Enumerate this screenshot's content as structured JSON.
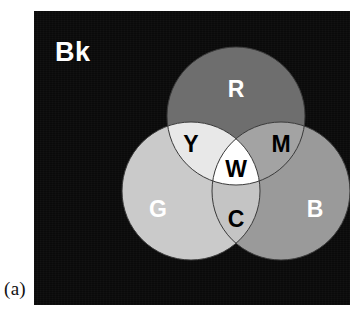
{
  "figure": {
    "caption": "(a)",
    "background_label": "Bk",
    "panel_color": "#0a0a0a"
  },
  "chart_data": {
    "type": "venn",
    "title": "",
    "subtitle": "",
    "legend_position": "none",
    "grid": false,
    "background": {
      "label": "Bk",
      "meaning": "Black",
      "color": "#0a0a0a",
      "text_color": "#ffffff"
    },
    "sets": [
      {
        "id": "R",
        "label": "R",
        "meaning": "Red",
        "color": "#6e6e6e",
        "text_color": "#ffffff",
        "cx": 202,
        "cy": 105,
        "r": 69,
        "label_x": 202,
        "label_y": 80
      },
      {
        "id": "G",
        "label": "G",
        "meaning": "Green",
        "color": "#cacaca",
        "text_color": "#ffffff",
        "cx": 157,
        "cy": 180,
        "r": 69,
        "label_x": 124,
        "label_y": 200
      },
      {
        "id": "B",
        "label": "B",
        "meaning": "Blue",
        "color": "#9a9a9a",
        "text_color": "#ffffff",
        "cx": 247,
        "cy": 180,
        "r": 69,
        "label_x": 281,
        "label_y": 200
      }
    ],
    "intersections": [
      {
        "id": "Y",
        "label": "Y",
        "meaning": "Yellow",
        "members": [
          "R",
          "G"
        ],
        "color": "#e8e8e8",
        "text_color": "#000000",
        "label_x": 157,
        "label_y": 135
      },
      {
        "id": "M",
        "label": "M",
        "meaning": "Magenta",
        "members": [
          "R",
          "B"
        ],
        "color": "#a3a3a3",
        "text_color": "#000000",
        "label_x": 247,
        "label_y": 135
      },
      {
        "id": "C",
        "label": "C",
        "meaning": "Cyan",
        "members": [
          "G",
          "B"
        ],
        "color": "#c4c4c4",
        "text_color": "#000000",
        "label_x": 202,
        "label_y": 210
      },
      {
        "id": "W",
        "label": "W",
        "meaning": "White",
        "members": [
          "R",
          "G",
          "B"
        ],
        "color": "#ffffff",
        "text_color": "#000000",
        "label_x": 202,
        "label_y": 160
      }
    ],
    "outline_color": "#3a3a3a"
  }
}
